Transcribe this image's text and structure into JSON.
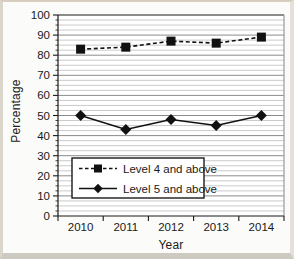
{
  "figure": {
    "background": "#fbfbf9",
    "frame_colors": {
      "top": "#d8cec0",
      "left": "#dad6cb",
      "right": "#e4e1da",
      "bottom": "#cdcac2"
    }
  },
  "chart_data": {
    "type": "line",
    "title": "",
    "xlabel": "Year",
    "ylabel": "Percentage",
    "categories": [
      "2010",
      "2011",
      "2012",
      "2013",
      "2014"
    ],
    "series": [
      {
        "name": "Level 4 and above",
        "values": [
          83,
          84,
          87,
          86,
          89
        ],
        "marker": "square",
        "line_style": "dashed",
        "color": "#111111"
      },
      {
        "name": "Level 5 and above",
        "values": [
          50,
          43,
          48,
          45,
          50
        ],
        "marker": "diamond",
        "line_style": "solid",
        "color": "#111111"
      }
    ],
    "ylim": [
      0,
      100
    ],
    "ytick_step": 10,
    "yminor_step": 2.5,
    "ytick_labels": [
      "0",
      "10",
      "20",
      "30",
      "40",
      "50",
      "60",
      "70",
      "80",
      "90",
      "100"
    ],
    "grid": "horizontal",
    "legend_position": "inside-bottom-left",
    "colors": {
      "minor_grid": "#bdbdbd",
      "major_grid": "#8b8b8b",
      "axis": "#1a1a1a",
      "frame_right": "#999999",
      "text": "#1a1a1a",
      "plot_bg": "#ffffff"
    }
  }
}
